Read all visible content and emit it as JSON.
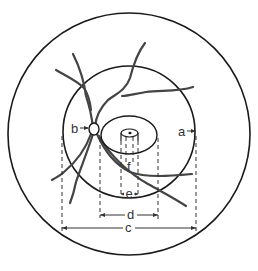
{
  "diagram": {
    "labels": {
      "a": "a",
      "b": "b",
      "c": "c",
      "d": "d",
      "e": "e",
      "f": "f"
    },
    "colors": {
      "stroke": "#1a1a1a",
      "vessel": "#444444",
      "background": "#ffffff"
    }
  }
}
